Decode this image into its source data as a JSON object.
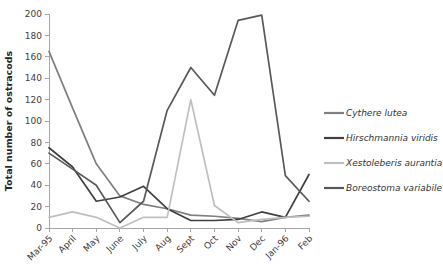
{
  "chart_data": {
    "type": "line",
    "title": "",
    "xlabel": "",
    "ylabel": "Total number of ostracods",
    "ylim": [
      0,
      200
    ],
    "yticks": [
      0,
      20,
      40,
      60,
      80,
      100,
      120,
      140,
      160,
      180,
      200
    ],
    "grid": false,
    "legend_position": "right",
    "categories": [
      "Mar-95",
      "April",
      "May",
      "June",
      "July",
      "Aug",
      "Sept",
      "Oct",
      "Nov",
      "Dec",
      "Jan-96",
      "Feb"
    ],
    "series": [
      {
        "name": "Cythere lutea",
        "color": "#7f7f7f",
        "values": [
          165,
          112,
          60,
          30,
          22,
          18,
          12,
          11,
          9,
          6,
          10,
          12
        ]
      },
      {
        "name": "Hirschmannia viridis",
        "color": "#404040",
        "values": [
          75,
          57,
          25,
          29,
          39,
          18,
          7,
          7,
          8,
          15,
          10,
          50
        ]
      },
      {
        "name": "Xestoleberis aurantia",
        "color": "#bfbfbf",
        "values": [
          10,
          15,
          10,
          0,
          10,
          10,
          120,
          21,
          5,
          8,
          10,
          11
        ]
      },
      {
        "name": "Boreostoma variabile",
        "color": "#595959",
        "values": [
          70,
          55,
          40,
          5,
          25,
          110,
          150,
          124,
          194,
          199,
          49,
          25
        ]
      }
    ]
  },
  "legend": {
    "items": [
      {
        "label": "Cythere lutea",
        "color": "#7f7f7f"
      },
      {
        "label": "Hirschmannia viridis",
        "color": "#404040"
      },
      {
        "label": "Xestoleberis aurantia",
        "color": "#bfbfbf"
      },
      {
        "label": "Boreostoma variabile",
        "color": "#595959"
      }
    ]
  },
  "axes": {
    "y_title": "Total number of ostracods",
    "y_tick_labels": [
      "0",
      "20",
      "40",
      "60",
      "80",
      "100",
      "120",
      "140",
      "160",
      "180",
      "200"
    ],
    "x_tick_labels": [
      "Mar-95",
      "April",
      "May",
      "June",
      "July",
      "Aug",
      "Sept",
      "Oct",
      "Nov",
      "Dec",
      "Jan-96",
      "Feb"
    ]
  }
}
